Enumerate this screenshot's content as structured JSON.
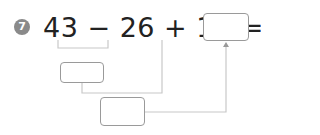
{
  "problem": {
    "number": "7",
    "expression": "43 − 26 + 16 =",
    "answer_box": "",
    "step1_box": "",
    "step2_box": ""
  },
  "colors": {
    "text": "#222222",
    "badge": "#8a8a8a",
    "box_border": "#9a9a9a",
    "connector": "#c8c8c8"
  }
}
